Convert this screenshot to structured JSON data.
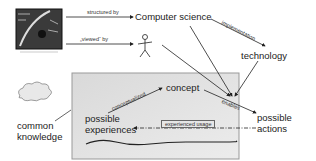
{
  "diagram": {
    "nodes": {
      "painting": {
        "label": "medieval cosmos woodcut image",
        "icon": "artwork-image"
      },
      "computer_science": {
        "label": "Computer science"
      },
      "person": {
        "label": "",
        "icon": "stick-figure"
      },
      "technology": {
        "label": "technology"
      },
      "concept": {
        "label": "concept"
      },
      "possible_experiences": {
        "line1": "possible",
        "line2": "experiences"
      },
      "possible_actions": {
        "line1": "possible",
        "line2": "actions"
      },
      "common_knowledge": {
        "line1": "common",
        "line2": "knowledge",
        "icon": "cloud"
      }
    },
    "edges": {
      "structured_by": "structured by",
      "viewed_by": "„viewed“ by",
      "implementation": "implementation",
      "conceptualized": "conceptualized",
      "enables": "enables",
      "experienced_usage": "experienced usage"
    },
    "colors": {
      "box_fill": "#e3e3e3",
      "box_border": "#888888",
      "line": "#222222",
      "text": "#222222"
    }
  }
}
